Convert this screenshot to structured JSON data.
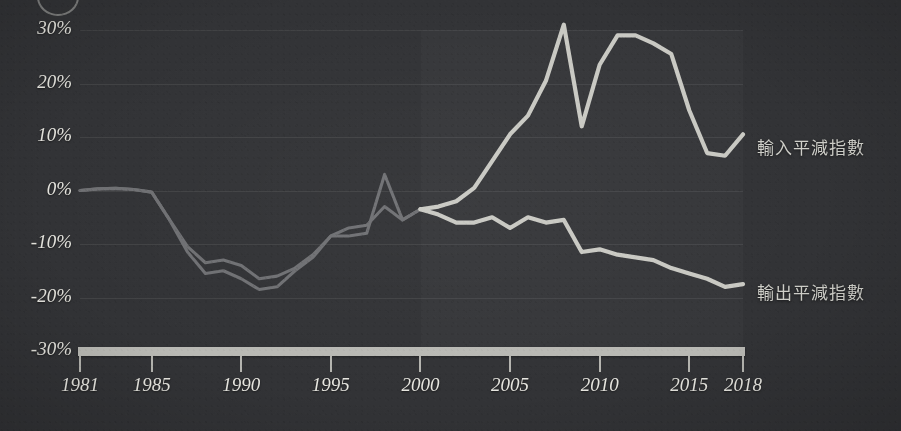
{
  "chart_data": {
    "type": "line",
    "title": "",
    "subtitle": "",
    "xlabel": "",
    "ylabel": "",
    "xlim": [
      1981,
      2018
    ],
    "ylim": [
      -30,
      30
    ],
    "ytick_values": [
      30,
      20,
      10,
      0,
      -10,
      -20,
      -30
    ],
    "ytick_labels": [
      "30%",
      "20%",
      "10%",
      "0%",
      "-10%",
      "-20%",
      "-30%"
    ],
    "xtick_values": [
      1981,
      1985,
      1990,
      1995,
      2000,
      2005,
      2010,
      2015,
      2018
    ],
    "xtick_labels": [
      "1981",
      "1985",
      "1990",
      "1995",
      "2000",
      "2005",
      "2010",
      "2015",
      "2018"
    ],
    "grid": true,
    "legend_position": "right-inline",
    "x": [
      1981,
      1982,
      1983,
      1984,
      1985,
      1986,
      1987,
      1988,
      1989,
      1990,
      1991,
      1992,
      1993,
      1994,
      1995,
      1996,
      1997,
      1998,
      1999,
      2000,
      2001,
      2002,
      2003,
      2004,
      2005,
      2006,
      2007,
      2008,
      2009,
      2010,
      2011,
      2012,
      2013,
      2014,
      2015,
      2016,
      2017,
      2018
    ],
    "series": [
      {
        "name": "輸入平減指數",
        "color": "#c9c9c3",
        "values": [
          0,
          0.3,
          0.4,
          0.2,
          -0.3,
          -5.5,
          -10.5,
          -13.5,
          -13,
          -14,
          -16.5,
          -16,
          -14.5,
          -12,
          -8.5,
          -7,
          -6.5,
          -3,
          -5.5,
          -3.5,
          -3,
          -2,
          0.5,
          5.5,
          10.5,
          14,
          20.5,
          31,
          12,
          23.5,
          29,
          29,
          27.5,
          25.5,
          15,
          7,
          6.5,
          10.5
        ]
      },
      {
        "name": "輸出平減指數",
        "color": "#c9c9c3",
        "values": [
          0,
          0.3,
          0.4,
          0.2,
          -0.3,
          -5.5,
          -11.5,
          -15.5,
          -15,
          -16.5,
          -18.5,
          -18,
          -15,
          -12.5,
          -8.5,
          -8.5,
          -8,
          3,
          -5.5,
          -3.5,
          -4.5,
          -6,
          -6,
          -5,
          -7,
          -5,
          -6,
          -5.5,
          -11.5,
          -11,
          -12,
          -12.5,
          -13,
          -14.5,
          -15.5,
          -16.5,
          -18,
          -17.5
        ]
      }
    ]
  },
  "axis": {
    "ylabels": [
      "30%",
      "20%",
      "10%",
      "0%",
      "-10%",
      "-20%",
      "-30%"
    ],
    "xlabels": [
      "1981",
      "1985",
      "1990",
      "1995",
      "2000",
      "2005",
      "2010",
      "2015",
      "2018"
    ]
  },
  "legend": {
    "import_label": "輸入平減指數",
    "export_label": "輸出平減指數"
  },
  "colors": {
    "background": "#323336",
    "line_bright": "#c9c9c3",
    "line_dim": "#6f7073",
    "axis": "#b9b9b4",
    "text": "#e4e3dd"
  }
}
